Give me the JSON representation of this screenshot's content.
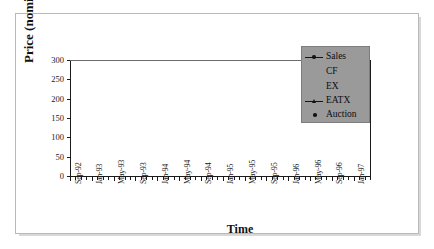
{
  "chart_data": {
    "type": "line",
    "title": "",
    "xlabel": "Time",
    "ylabel": "Price (nominal $/ton)",
    "ylim": [
      0,
      300
    ],
    "yticks": [
      0,
      50,
      100,
      150,
      200,
      250,
      300
    ],
    "grid": false,
    "legend_position": "upper right",
    "legend_entries": [
      "Sales",
      "CF",
      "EX",
      "EATX",
      "Auction"
    ],
    "x_tick_labels": [
      "Sep-92",
      "Jan-93",
      "May-93",
      "Sep-93",
      "Jan-94",
      "May-94",
      "Sep-94",
      "Jan-95",
      "May-95",
      "Sep-95",
      "Jan-96",
      "May-96",
      "Sep-96",
      "Jan-97"
    ],
    "x_tick_interval_months": 4,
    "x_axis_span": "Sep-92 to Mar-97",
    "series": [
      {
        "name": "Sales",
        "marker": "filled-circle",
        "line": "solid-black",
        "points": [
          {
            "x": "Sep-92",
            "y": 298
          },
          {
            "x": "Nov-92",
            "y": 263
          }
        ]
      },
      {
        "name": "Sales",
        "marker": "filled-circle",
        "line": "solid-black",
        "points": [
          {
            "x": "Jun-93",
            "y": 176
          },
          {
            "x": "Jul-93",
            "y": 206
          }
        ]
      },
      {
        "name": "CF",
        "marker": "none",
        "line": "solid-gray-300",
        "points": [
          {
            "x": "Sep-92",
            "y": 300
          },
          {
            "x": "Feb-96",
            "y": 300
          }
        ]
      },
      {
        "name": "EATX",
        "marker": "triangle",
        "line": "solid-gray",
        "points": [
          {
            "x": "Jun-93",
            "y": 170
          },
          {
            "x": "Jul-93",
            "y": 168
          },
          {
            "x": "Aug-93",
            "y": 168
          },
          {
            "x": "Sep-93",
            "y": 169
          },
          {
            "x": "Oct-93",
            "y": 172
          },
          {
            "x": "Nov-93",
            "y": 176
          },
          {
            "x": "Dec-93",
            "y": 177
          },
          {
            "x": "Jan-94",
            "y": 178
          },
          {
            "x": "Feb-94",
            "y": 180
          },
          {
            "x": "Mar-94",
            "y": 179
          },
          {
            "x": "Apr-94",
            "y": 175
          },
          {
            "x": "May-94",
            "y": 170
          },
          {
            "x": "Jun-94",
            "y": 166
          },
          {
            "x": "Jul-94",
            "y": 162
          },
          {
            "x": "Aug-94",
            "y": 148
          },
          {
            "x": "Sep-94",
            "y": 147
          },
          {
            "x": "Oct-94",
            "y": 147
          },
          {
            "x": "Nov-94",
            "y": 147
          },
          {
            "x": "Dec-94",
            "y": 146
          },
          {
            "x": "Jan-95",
            "y": 145
          },
          {
            "x": "Feb-95",
            "y": 143
          },
          {
            "x": "Mar-95",
            "y": 140
          },
          {
            "x": "Apr-95",
            "y": 136
          },
          {
            "x": "May-95",
            "y": 133
          },
          {
            "x": "Jun-95",
            "y": 131
          },
          {
            "x": "Jul-95",
            "y": 131
          },
          {
            "x": "Aug-95",
            "y": 130
          },
          {
            "x": "Sep-95",
            "y": 130
          },
          {
            "x": "Oct-95",
            "y": 129
          },
          {
            "x": "Nov-95",
            "y": 128
          },
          {
            "x": "Dec-95",
            "y": 126
          },
          {
            "x": "Jan-96",
            "y": 122
          },
          {
            "x": "Feb-96",
            "y": 113
          },
          {
            "x": "Mar-96",
            "y": 103
          },
          {
            "x": "Apr-96",
            "y": 93
          },
          {
            "x": "May-96",
            "y": 82
          },
          {
            "x": "Jun-96",
            "y": 72
          },
          {
            "x": "Jul-96",
            "y": 67
          },
          {
            "x": "Aug-96",
            "y": 78
          },
          {
            "x": "Sep-96",
            "y": 82
          },
          {
            "x": "Oct-96",
            "y": 80
          },
          {
            "x": "Nov-96",
            "y": 79
          },
          {
            "x": "Dec-96",
            "y": 80
          },
          {
            "x": "Jan-97",
            "y": 82
          },
          {
            "x": "Feb-97",
            "y": 85
          },
          {
            "x": "Mar-97",
            "y": 88
          },
          {
            "x": "Apr-97",
            "y": 90
          },
          {
            "x": "May-97",
            "y": 92
          },
          {
            "x": "Jun-97",
            "y": 96
          },
          {
            "x": "Jul-97",
            "y": 100
          },
          {
            "x": "Aug-97",
            "y": 106
          }
        ]
      },
      {
        "name": "Auction",
        "marker": "filled-circle-only",
        "line": "none",
        "points": [
          {
            "x": "Apr-93",
            "y": 130
          },
          {
            "x": "Jul-93",
            "y": 206
          },
          {
            "x": "Nov-93",
            "y": 205
          },
          {
            "x": "Apr-94",
            "y": 150
          },
          {
            "x": "Jul-96",
            "y": 67
          },
          {
            "x": "Aug-97",
            "y": 107
          }
        ]
      }
    ]
  },
  "axes": {
    "y_title": "Price (nominal $/ton)",
    "x_title": "Time",
    "y_labels": [
      "300",
      "250",
      "200",
      "150",
      "100",
      "50",
      "0"
    ]
  },
  "legend": {
    "items": [
      {
        "label": "Sales",
        "marker": "line-with-dot"
      },
      {
        "label": "CF",
        "marker": "none"
      },
      {
        "label": "EX",
        "marker": "none"
      },
      {
        "label": "EATX",
        "marker": "line-with-triangle"
      },
      {
        "label": "Auction",
        "marker": "dot"
      }
    ]
  }
}
